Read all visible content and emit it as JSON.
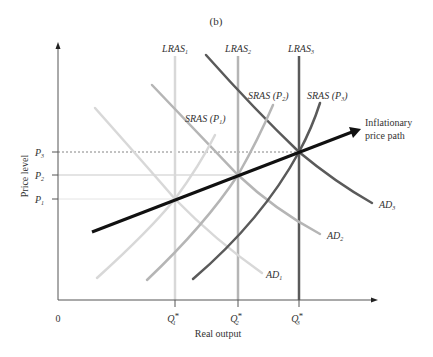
{
  "panel_label": "(b)",
  "axes": {
    "origin_label": "0",
    "x_label": "Real output",
    "y_label": "Price level",
    "y_ticks": [
      {
        "base": "P",
        "sub": "3",
        "y": 152
      },
      {
        "base": "P",
        "sub": "2",
        "y": 175
      },
      {
        "base": "P",
        "sub": "1",
        "y": 199
      }
    ],
    "x_ticks": [
      {
        "base": "Q",
        "sup": "*",
        "sub": "1",
        "x": 175
      },
      {
        "base": "Q",
        "sup": "*",
        "sub": "2",
        "x": 238
      },
      {
        "base": "Q",
        "sup": "*",
        "sub": "3",
        "x": 299
      }
    ]
  },
  "curves": {
    "lras": [
      {
        "label": "LRAS",
        "sub": "1",
        "x": 175,
        "color": "#d8d8d8"
      },
      {
        "label": "LRAS",
        "sub": "2",
        "x": 238,
        "color": "#b5b5b5"
      },
      {
        "label": "LRAS",
        "sub": "3",
        "x": 299,
        "color": "#5a5a5a"
      }
    ],
    "sras": [
      {
        "label": "SRAS (P",
        "sub": "1",
        "close": ")",
        "color": "#d8d8d8"
      },
      {
        "label": "SRAS (P",
        "sub": "2",
        "close": ")",
        "color": "#b5b5b5"
      },
      {
        "label": "SRAS (P",
        "sub": "3",
        "close": ")",
        "color": "#5a5a5a"
      }
    ],
    "ad": [
      {
        "label": "AD",
        "sub": "1",
        "color": "#d8d8d8"
      },
      {
        "label": "AD",
        "sub": "2",
        "color": "#b5b5b5"
      },
      {
        "label": "AD",
        "sub": "3",
        "color": "#5a5a5a"
      }
    ]
  },
  "path": {
    "label_line1": "Inflationary",
    "label_line2": "price path",
    "color": "#111111"
  }
}
